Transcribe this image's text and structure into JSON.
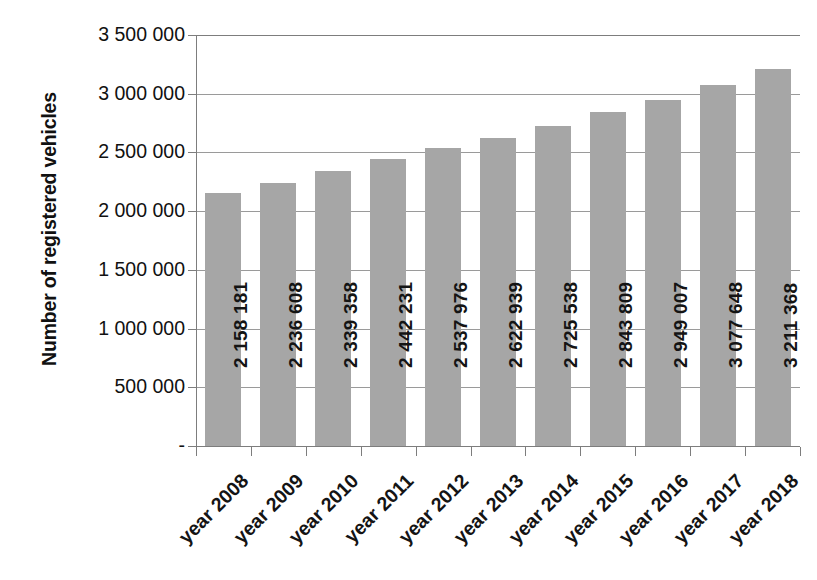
{
  "chart_data": {
    "type": "bar",
    "title": "",
    "subtitle": "",
    "xlabel": "",
    "ylabel": "Number of registered vehicles",
    "categories": [
      "year 2008",
      "year 2009",
      "year 2010",
      "year 2011",
      "year 2012",
      "year 2013",
      "year 2014",
      "year 2015",
      "year 2016",
      "year 2017",
      "year 2018"
    ],
    "values": [
      2158181,
      2236608,
      2339358,
      2442231,
      2537976,
      2622939,
      2725538,
      2843809,
      2949007,
      3077648,
      3211368
    ],
    "value_labels": [
      "2 158 181",
      "2 236 608",
      "2 339 358",
      "2 442 231",
      "2 537 976",
      "2 622 939",
      "2 725 538",
      "2 843 809",
      "2 949 007",
      "3 077 648",
      "3 211 368"
    ],
    "ylim": [
      0,
      3500000
    ],
    "ytick_values": [
      0,
      500000,
      1000000,
      1500000,
      2000000,
      2500000,
      3000000,
      3500000
    ],
    "ytick_labels": [
      "-",
      "500 000",
      "1 000 000",
      "1 500 000",
      "2 000 000",
      "2 500 000",
      "3 000 000",
      "3 500 000"
    ],
    "grid": true,
    "legend": false,
    "legend_position": "none",
    "bar_color": "#a6a6a6",
    "gridline_color": "#9a9a9a",
    "axis_color": "#7d7d7d",
    "text_color": "#141414",
    "background_color": "#ffffff"
  }
}
